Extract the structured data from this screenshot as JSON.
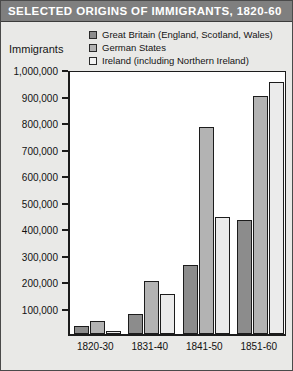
{
  "title": "SELECTED ORIGINS OF IMMIGRANTS, 1820-60",
  "axis_title": "Immigrants",
  "colors": {
    "title_bar": "#7f7f7f",
    "page_background": "#e9e9e7",
    "plot_background": "#ffffff",
    "great_britain": "#8c8c8c",
    "german_states": "#b3b3b3",
    "ireland": "#ebebeb",
    "frame": "#1c1c1c"
  },
  "legend": {
    "position": "top",
    "items": [
      {
        "label": "Great Britain (England, Scotland, Wales)",
        "swatch": "gb"
      },
      {
        "label": "German States",
        "swatch": "german"
      },
      {
        "label": "Ireland (including Northern Ireland)",
        "swatch": "ireland"
      }
    ]
  },
  "yticks": [
    {
      "label": "1,000,000",
      "value": 1000000
    },
    {
      "label": "900,000",
      "value": 900000
    },
    {
      "label": "800,000",
      "value": 800000
    },
    {
      "label": "700,000",
      "value": 700000
    },
    {
      "label": "600,000",
      "value": 600000
    },
    {
      "label": "500,000",
      "value": 500000
    },
    {
      "label": "400,000",
      "value": 400000
    },
    {
      "label": "300,000",
      "value": 300000
    },
    {
      "label": "200,000",
      "value": 200000
    },
    {
      "label": "100,000",
      "value": 100000
    }
  ],
  "chart_data": {
    "type": "bar",
    "title": "SELECTED ORIGINS OF IMMIGRANTS, 1820-60",
    "xlabel": "",
    "ylabel": "Immigrants",
    "ylim": [
      0,
      1000000
    ],
    "ytick_step": 100000,
    "grid": false,
    "legend_position": "top",
    "categories": [
      "1820-30",
      "1831-40",
      "1841-50",
      "1851-60"
    ],
    "series": [
      {
        "name": "Great Britain (England, Scotland, Wales)",
        "values": [
          30000,
          75000,
          260000,
          430000
        ]
      },
      {
        "name": "German States",
        "values": [
          50000,
          200000,
          780000,
          900000
        ]
      },
      {
        "name": "Ireland (including Northern Ireland)",
        "values": [
          10000,
          150000,
          440000,
          950000
        ]
      }
    ]
  }
}
